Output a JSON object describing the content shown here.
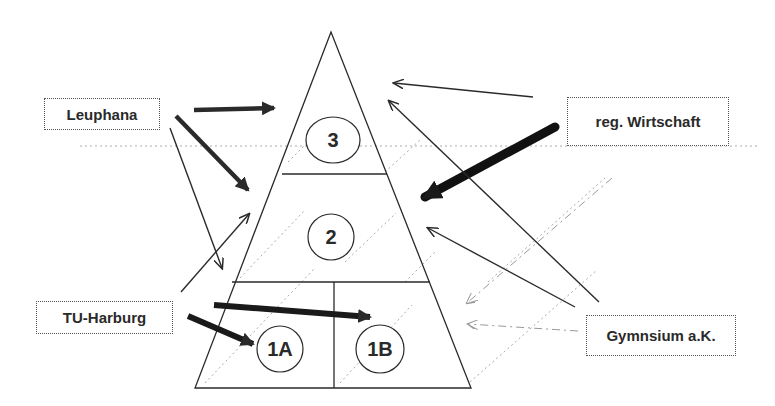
{
  "diagram": {
    "type": "pyramid-influence-diagram",
    "actors": [
      {
        "id": "leuphana",
        "label": "Leuphana"
      },
      {
        "id": "tu_harburg",
        "label": "TU-Harburg"
      },
      {
        "id": "reg_wirtschaft",
        "label": "reg. Wirtschaft"
      },
      {
        "id": "gymnasium",
        "label": "Gymnsium a.K."
      }
    ],
    "levels": [
      {
        "id": "3",
        "label": "3"
      },
      {
        "id": "2",
        "label": "2"
      },
      {
        "id": "1A",
        "label": "1A"
      },
      {
        "id": "1B",
        "label": "1B"
      }
    ],
    "relations": [
      {
        "from": "Leuphana",
        "to": "3",
        "weight": "strong"
      },
      {
        "from": "Leuphana",
        "to": "2",
        "weight": "strong"
      },
      {
        "from": "Leuphana",
        "to": "1A",
        "weight": "thin"
      },
      {
        "from": "TU-Harburg",
        "to": "2",
        "weight": "thin"
      },
      {
        "from": "TU-Harburg",
        "to": "1A",
        "weight": "strong"
      },
      {
        "from": "TU-Harburg",
        "to": "1B",
        "weight": "strong"
      },
      {
        "from": "reg. Wirtschaft",
        "to": "3",
        "weight": "thin"
      },
      {
        "from": "reg. Wirtschaft",
        "to": "2",
        "weight": "very-strong"
      },
      {
        "from": "Gymnsium a.K.",
        "to": "3",
        "weight": "thin"
      },
      {
        "from": "Gymnsium a.K.",
        "to": "2",
        "weight": "thin"
      },
      {
        "from": "Gymnsium a.K.",
        "to": "1B",
        "weight": "dashed"
      },
      {
        "from": "Gymnsium a.K.",
        "to": "1B",
        "weight": "dashed"
      }
    ],
    "colors": {
      "line": "#2a2a2a",
      "dotted": "#9a9a9a",
      "background": "#ffffff"
    }
  }
}
